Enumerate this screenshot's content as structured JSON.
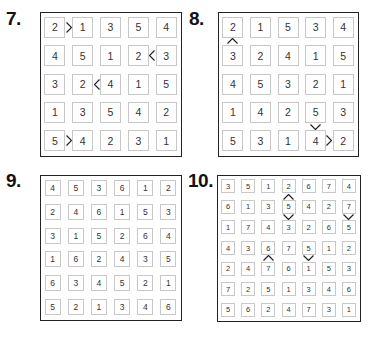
{
  "puzzles": [
    {
      "label": "7.",
      "size": 5,
      "rows": [
        [
          2,
          1,
          3,
          5,
          4
        ],
        [
          4,
          5,
          1,
          2,
          3
        ],
        [
          3,
          2,
          4,
          1,
          5
        ],
        [
          1,
          3,
          5,
          4,
          2
        ],
        [
          5,
          4,
          2,
          3,
          1
        ]
      ],
      "inequalities": [
        {
          "row": 0,
          "col": 0,
          "dir": "right",
          "symbol": ">"
        },
        {
          "row": 1,
          "col": 3,
          "dir": "right",
          "symbol": "<"
        },
        {
          "row": 2,
          "col": 1,
          "dir": "right",
          "symbol": "<"
        },
        {
          "row": 4,
          "col": 0,
          "dir": "right",
          "symbol": ">"
        }
      ]
    },
    {
      "label": "8.",
      "size": 5,
      "rows": [
        [
          2,
          1,
          5,
          3,
          4
        ],
        [
          3,
          2,
          4,
          1,
          5
        ],
        [
          4,
          5,
          3,
          2,
          1
        ],
        [
          1,
          4,
          2,
          5,
          3
        ],
        [
          5,
          3,
          1,
          4,
          2
        ]
      ],
      "inequalities": [
        {
          "row": 0,
          "col": 0,
          "dir": "down",
          "symbol": "^"
        },
        {
          "row": 3,
          "col": 3,
          "dir": "down",
          "symbol": "v"
        },
        {
          "row": 4,
          "col": 3,
          "dir": "right",
          "symbol": ">"
        }
      ]
    },
    {
      "label": "9.",
      "size": 6,
      "rows": [
        [
          4,
          5,
          3,
          6,
          1,
          2
        ],
        [
          2,
          4,
          6,
          1,
          5,
          3
        ],
        [
          3,
          1,
          5,
          2,
          6,
          4
        ],
        [
          1,
          6,
          2,
          4,
          3,
          5
        ],
        [
          6,
          3,
          4,
          5,
          2,
          1
        ],
        [
          5,
          2,
          1,
          3,
          4,
          6
        ]
      ],
      "inequalities": []
    },
    {
      "label": "10.",
      "size": 7,
      "rows": [
        [
          3,
          5,
          1,
          2,
          6,
          7,
          4
        ],
        [
          6,
          1,
          3,
          5,
          4,
          2,
          7
        ],
        [
          1,
          7,
          4,
          3,
          2,
          6,
          5
        ],
        [
          4,
          3,
          6,
          7,
          5,
          1,
          2
        ],
        [
          2,
          4,
          7,
          6,
          1,
          5,
          3
        ],
        [
          7,
          2,
          5,
          1,
          3,
          4,
          6
        ],
        [
          5,
          6,
          2,
          4,
          7,
          3,
          1
        ]
      ],
      "inequalities": [
        {
          "row": 0,
          "col": 3,
          "dir": "down",
          "symbol": "^"
        },
        {
          "row": 1,
          "col": 3,
          "dir": "down",
          "symbol": "v"
        },
        {
          "row": 1,
          "col": 6,
          "dir": "down",
          "symbol": "v"
        },
        {
          "row": 3,
          "col": 2,
          "dir": "down",
          "symbol": "^"
        },
        {
          "row": 3,
          "col": 4,
          "dir": "down",
          "symbol": "v"
        }
      ]
    }
  ]
}
